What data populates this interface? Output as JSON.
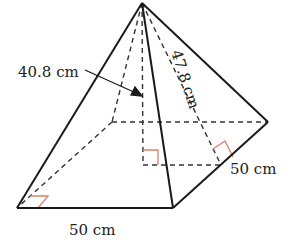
{
  "figure": {
    "type": "square-based pyramid",
    "labels": {
      "height": "40.8 cm",
      "slant_height": "47.8 cm",
      "base_front": "50 cm",
      "base_side": "50 cm"
    },
    "colors": {
      "line": "#1a1a1a",
      "dashed": "#333333",
      "right_angle_mark": "#d9826b"
    },
    "vertices": {
      "apex": [
        142,
        3
      ],
      "front_left": [
        17,
        208
      ],
      "front_right": [
        173,
        208
      ],
      "back_right": [
        268,
        122
      ],
      "back_left": [
        112,
        122
      ],
      "base_center": [
        143,
        165
      ],
      "right_edge_mid": [
        221,
        165
      ]
    }
  }
}
